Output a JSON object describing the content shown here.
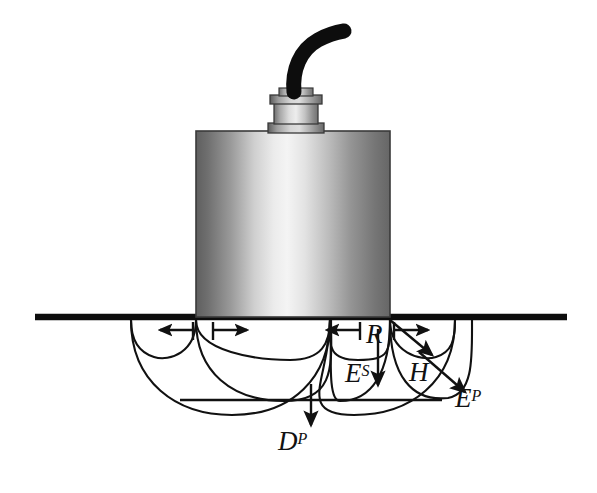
{
  "figure": {
    "type": "technical-schematic",
    "background_color": "#ffffff",
    "ink_color": "#111111",
    "width": 597,
    "height": 493
  },
  "labels": [
    {
      "id": "R",
      "base": "R",
      "sup": "",
      "meaning": "Rayleigh surface wave",
      "x": 366,
      "y": 321
    },
    {
      "id": "ES",
      "base": "E",
      "sup": "S",
      "meaning": "Shear (S) body wave energy",
      "x": 345,
      "y": 360
    },
    {
      "id": "H",
      "base": "H",
      "sup": "",
      "meaning": "Horizontal shear component",
      "x": 409,
      "y": 359
    },
    {
      "id": "EP",
      "base": "E",
      "sup": "P",
      "meaning": "Compression (P) wave energy",
      "x": 455,
      "y": 385
    },
    {
      "id": "DP",
      "base": "D",
      "sup": "P",
      "meaning": "Downward compression (P) wave",
      "x": 278,
      "y": 428
    }
  ],
  "components": {
    "cable": {
      "name": "cable",
      "color": "#0d0d0d"
    },
    "connector": {
      "name": "connector",
      "color_light": "#d8d8d8",
      "color_dark": "#6d6d6d"
    },
    "body": {
      "name": "transducer-body",
      "color_edge": "#6b6b6b",
      "color_highlight": "#f2f2f2"
    },
    "ground_line": {
      "name": "ground-surface-line",
      "color": "#0d0d0d",
      "x1": 35,
      "x2": 567,
      "y": 317
    },
    "base_line": {
      "name": "wave-base-line",
      "color": "#111111",
      "y": 400
    }
  },
  "wave_fronts": {
    "left_group_center_x": 196,
    "right_group_center_x": 390,
    "surface_y": 317,
    "lobes": [
      {
        "name": "inner-lobe",
        "rx": 62,
        "ry": 40
      },
      {
        "name": "middle-lobe",
        "rx": 108,
        "ry": 62
      },
      {
        "name": "outer-lobe",
        "rx": 132,
        "ry": 84
      }
    ]
  },
  "arrows": {
    "rayleigh_left_pair": {
      "name": "rayleigh-arrows-left",
      "direction": "horizontal-opposed"
    },
    "rayleigh_right_pair": {
      "name": "rayleigh-arrows-right",
      "direction": "horizontal-opposed"
    },
    "shear_down": {
      "name": "shear-arrow",
      "direction": "down"
    },
    "h_diagonal": {
      "name": "h-arrow",
      "direction": "down-right"
    },
    "p_diagonal": {
      "name": "p-arrow",
      "direction": "down-right"
    },
    "d_down": {
      "name": "d-arrow",
      "direction": "down"
    }
  }
}
